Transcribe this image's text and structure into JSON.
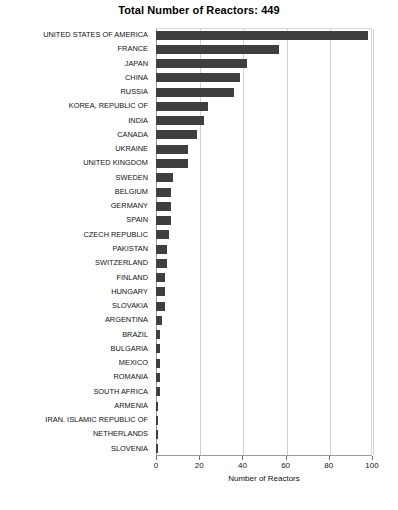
{
  "chart_data": {
    "type": "bar",
    "orientation": "horizontal",
    "title": "Total Number of Reactors: 449",
    "xlabel": "Number of Reactors",
    "ylabel": "",
    "xlim": [
      0,
      100
    ],
    "xticks": [
      0,
      20,
      40,
      60,
      80,
      100
    ],
    "grid": true,
    "legend": "none",
    "bar_color": "#3f3f3f",
    "total": 449,
    "categories": [
      "UNITED STATES OF AMERICA",
      "FRANCE",
      "JAPAN",
      "CHINA",
      "RUSSIA",
      "KOREA, REPUBLIC OF",
      "INDIA",
      "CANADA",
      "UKRAINE",
      "UNITED KINGDOM",
      "SWEDEN",
      "BELGIUM",
      "GERMANY",
      "SPAIN",
      "CZECH REPUBLIC",
      "PAKISTAN",
      "SWITZERLAND",
      "FINLAND",
      "HUNGARY",
      "SLOVAKIA",
      "ARGENTINA",
      "BRAZIL",
      "BULGARIA",
      "MEXICO",
      "ROMANIA",
      "SOUTH AFRICA",
      "ARMENIA",
      "IRAN. ISLAMIC REPUBLIC OF",
      "NETHERLANDS",
      "SLOVENIA"
    ],
    "values": [
      98,
      57,
      42,
      39,
      36,
      24,
      22,
      19,
      15,
      15,
      8,
      7,
      7,
      7,
      6,
      5,
      5,
      4,
      4,
      4,
      3,
      2,
      2,
      2,
      2,
      2,
      1,
      1,
      1,
      1
    ]
  }
}
